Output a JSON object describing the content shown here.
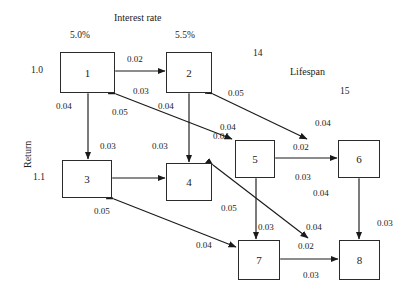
{
  "figure": {
    "type": "lattice-diagram",
    "axes": {
      "top_label": "Interest rate",
      "left_label": "Return",
      "depth_label": "Lifespan"
    },
    "axis_ticks": {
      "interest_rate": [
        "5.0%",
        "5.5%"
      ],
      "return": [
        "1.0",
        "1.1"
      ],
      "lifespan": [
        "14",
        "15"
      ]
    }
  },
  "nodes": [
    {
      "id": "1",
      "label": "1",
      "x": 60,
      "y": 52,
      "w": 55,
      "h": 41
    },
    {
      "id": "2",
      "label": "2",
      "x": 166,
      "y": 52,
      "w": 46,
      "h": 41
    },
    {
      "id": "3",
      "label": "3",
      "x": 62,
      "y": 160,
      "w": 50,
      "h": 38
    },
    {
      "id": "4",
      "label": "4",
      "x": 166,
      "y": 163,
      "w": 46,
      "h": 38
    },
    {
      "id": "5",
      "label": "5",
      "x": 235,
      "y": 140,
      "w": 40,
      "h": 38
    },
    {
      "id": "6",
      "label": "6",
      "x": 338,
      "y": 140,
      "w": 42,
      "h": 38
    },
    {
      "id": "7",
      "label": "7",
      "x": 238,
      "y": 240,
      "w": 42,
      "h": 40
    },
    {
      "id": "8",
      "label": "8",
      "x": 339,
      "y": 240,
      "w": 41,
      "h": 40
    }
  ],
  "edges": [
    {
      "from": "1",
      "to": "2",
      "axis": "interest-rate",
      "forward_rate": "0.02",
      "backward_rate": "0.03"
    },
    {
      "from": "3",
      "to": "4",
      "axis": "interest-rate",
      "forward_rate": "0.02",
      "backward_rate": "0.03"
    },
    {
      "from": "5",
      "to": "6",
      "axis": "interest-rate",
      "forward_rate": "0.02",
      "backward_rate": "0.03"
    },
    {
      "from": "7",
      "to": "8",
      "axis": "interest-rate",
      "forward_rate": "0.02",
      "backward_rate": "0.03"
    },
    {
      "from": "1",
      "to": "3",
      "axis": "return",
      "forward_rate": "0.04",
      "backward_rate": "0.03"
    },
    {
      "from": "2",
      "to": "4",
      "axis": "return",
      "forward_rate": "0.04",
      "backward_rate": "0.03"
    },
    {
      "from": "5",
      "to": "7",
      "axis": "return",
      "forward_rate": "0.04",
      "backward_rate": "0.03"
    },
    {
      "from": "6",
      "to": "8",
      "axis": "return",
      "forward_rate": "0.04",
      "backward_rate": "0.03"
    },
    {
      "from": "2",
      "to": "5",
      "axis": "lifespan",
      "forward_rate": "0.04",
      "backward_rate": "0.05"
    },
    {
      "from": "1",
      "to": "5",
      "axis": "lifespan",
      "forward_rate": "0.04",
      "backward_rate": "0.05"
    },
    {
      "from": "5",
      "to": "6",
      "axis": "lifespan",
      "forward_rate": "0.04",
      "backward_rate": "0.05"
    },
    {
      "from": "4",
      "to": "7",
      "axis": "lifespan",
      "forward_rate": "0.04",
      "backward_rate": "0.05"
    },
    {
      "from": "3",
      "to": "8",
      "axis": "lifespan",
      "forward_rate": "0.04",
      "backward_rate": "0.05"
    }
  ],
  "edge_labels": [
    {
      "name": "r-1-2-fwd",
      "text": "0.02",
      "x": 127,
      "y": 54
    },
    {
      "name": "r-1-2-bwd",
      "text": "0.03",
      "x": 133,
      "y": 86
    },
    {
      "name": "r-1-3-fwd",
      "text": "0.04",
      "x": 56,
      "y": 101
    },
    {
      "name": "r-1-3-bwd",
      "text": "0.03",
      "x": 100,
      "y": 141
    },
    {
      "name": "r-1-5-bwd",
      "text": "0.05",
      "x": 112,
      "y": 107
    },
    {
      "name": "r-2-4-fwd",
      "text": "0.04",
      "x": 158,
      "y": 101
    },
    {
      "name": "r-2-4-bwd",
      "text": "0.03",
      "x": 152,
      "y": 141
    },
    {
      "name": "r-2-5-bwd",
      "text": "0.05",
      "x": 228,
      "y": 88
    },
    {
      "name": "r-2-5-fwd",
      "text": "0.04",
      "x": 220,
      "y": 122
    },
    {
      "name": "r-5-6-fwd",
      "text": "0.02",
      "x": 293,
      "y": 142
    },
    {
      "name": "r-5-6-bwd",
      "text": "0.03",
      "x": 295,
      "y": 172
    },
    {
      "name": "r-5-6-diag",
      "text": "0.04",
      "x": 315,
      "y": 118
    },
    {
      "name": "r-5-7-fwd",
      "text": "0.04",
      "x": 213,
      "y": 131
    },
    {
      "name": "r-5-7-bwd",
      "text": "0.03",
      "x": 258,
      "y": 222
    },
    {
      "name": "r-6-8-fwd",
      "text": "0.04",
      "x": 313,
      "y": 188
    },
    {
      "name": "r-6-8-bwd",
      "text": "0.03",
      "x": 383,
      "y": 218
    },
    {
      "name": "r-4-7-bwd",
      "text": "0.05",
      "x": 221,
      "y": 203
    },
    {
      "name": "r-4-7-fwd",
      "text": "0.04",
      "x": 306,
      "y": 222
    },
    {
      "name": "r-3-8-bwd",
      "text": "0.05",
      "x": 94,
      "y": 206
    },
    {
      "name": "r-3-8-fwd",
      "text": "0.04",
      "x": 196,
      "y": 240
    },
    {
      "name": "r-7-8-fwd",
      "text": "0.02",
      "x": 298,
      "y": 241
    },
    {
      "name": "r-7-8-bwd",
      "text": "0.03",
      "x": 303,
      "y": 270
    }
  ],
  "axis_text": [
    {
      "name": "interest-rate-title",
      "text": "Interest rate",
      "x": 114,
      "y": 12
    },
    {
      "name": "interest-rate-tick-1",
      "text": "5.0%",
      "x": 70,
      "y": 30
    },
    {
      "name": "interest-rate-tick-2",
      "text": "5.5%",
      "x": 175,
      "y": 30
    },
    {
      "name": "lifespan-tick-1",
      "text": "14",
      "x": 253,
      "y": 48
    },
    {
      "name": "lifespan-title",
      "text": "Lifespan",
      "x": 290,
      "y": 66
    },
    {
      "name": "lifespan-tick-2",
      "text": "15",
      "x": 340,
      "y": 86
    },
    {
      "name": "return-tick-1",
      "text": "1.0",
      "x": 31,
      "y": 65
    },
    {
      "name": "return-tick-2",
      "text": "1.1",
      "x": 33,
      "y": 172
    }
  ]
}
